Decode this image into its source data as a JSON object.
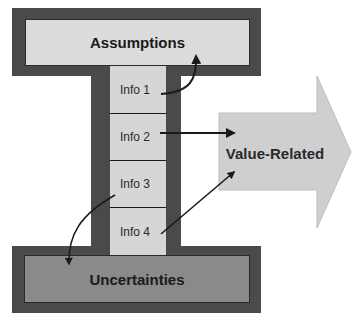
{
  "diagram": {
    "top_label": "Assumptions",
    "bottom_label": "Uncertainties",
    "arrow_label": "Value-Related",
    "info_items": [
      {
        "label": "Info 1",
        "target": "Assumptions"
      },
      {
        "label": "Info 2",
        "target": "Value-Related"
      },
      {
        "label": "Info 3",
        "target": "Uncertainties"
      },
      {
        "label": "Info 4",
        "target": "Value-Related"
      }
    ],
    "colors": {
      "frame": "#4a4a4a",
      "top_fill": "#dcdcdc",
      "bottom_fill": "#8a8a8a",
      "info_fill": "#d6d6d6",
      "arrow_fill": "#cfcfcf",
      "connector": "#1a1a1a"
    }
  }
}
